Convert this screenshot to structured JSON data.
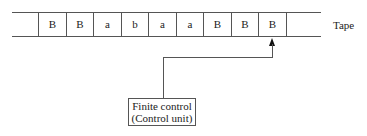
{
  "diagram": {
    "type": "turing-machine-tape",
    "tape": {
      "label": "Tape",
      "cells": [
        "B",
        "B",
        "a",
        "b",
        "a",
        "a",
        "B",
        "B",
        "B",
        ""
      ],
      "head_position_index": 8
    },
    "control": {
      "line1": "Finite control",
      "line2": "(Control unit)"
    },
    "colors": {
      "line": "#555555",
      "text": "#222222",
      "arrow": "#111111",
      "background": "#ffffff"
    }
  }
}
